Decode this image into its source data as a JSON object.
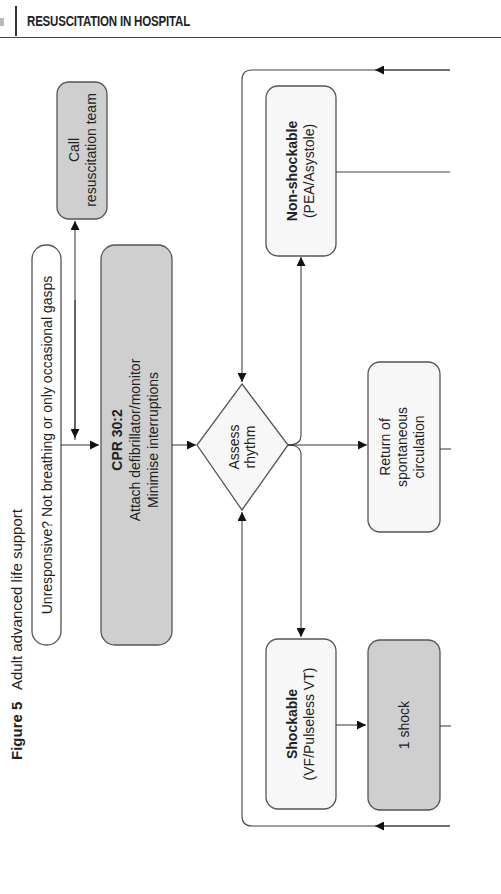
{
  "header": {
    "title": "RESUSCITATION IN HOSPITAL"
  },
  "caption": {
    "label": "Figure 5",
    "title": "Adult advanced life support"
  },
  "nodes": {
    "unresponsive": {
      "text": "Unresponsive? Not breathing or only occasional gasps"
    },
    "call_team": {
      "line1": "Call",
      "line2": "resuscitation team"
    },
    "cpr": {
      "line1": "CPR 30:2",
      "line2": "Attach defibrillator/monitor",
      "line3": "Minimise interruptions"
    },
    "assess": {
      "line1": "Assess",
      "line2": "rhythm"
    },
    "non_shockable": {
      "line1": "Non-shockable",
      "line2": "(PEA/Asystole)"
    },
    "rosc": {
      "line1": "Return of",
      "line2": "spontaneous",
      "line3": "circulation"
    },
    "shockable": {
      "line1": "Shockable",
      "line2": "(VF/Pulseless VT)"
    },
    "shock": {
      "line1": "1 shock"
    }
  },
  "colors": {
    "shaded_fill": "#cfcfcf",
    "light_fill": "#f7f7f7",
    "stroke": "#555555"
  }
}
